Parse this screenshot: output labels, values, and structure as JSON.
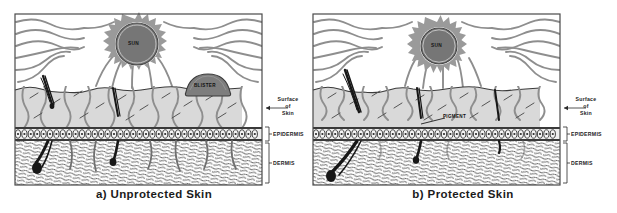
{
  "figure": {
    "type": "scientific-illustration",
    "panel_count": 2
  },
  "panels": [
    {
      "id": "a",
      "caption": "a)  Unprotected Skin",
      "sun_label": "SUN",
      "inner_labels": [
        {
          "name": "blister",
          "text": "BLISTER"
        }
      ],
      "side_labels": {
        "surface_line1": "Surface",
        "surface_line2": "of",
        "surface_line3": "Skin",
        "epidermis": "EPIDERMIS",
        "dermis": "DERMIS"
      }
    },
    {
      "id": "b",
      "caption": "b)  Protected Skin",
      "sun_label": "SUN",
      "inner_labels": [
        {
          "name": "pigment",
          "text": "PIGMENT"
        }
      ],
      "side_labels": {
        "surface_line1": "Surface",
        "surface_line2": "of",
        "surface_line3": "Skin",
        "epidermis": "EPIDERMIS",
        "dermis": "DERMIS"
      }
    }
  ],
  "colors": {
    "ray_gray": "#8e8e8e",
    "sun_fill": "#767676",
    "sun_burst": "#9a9a9a",
    "epidermis_fill": "#d9d9d9",
    "cell_band": "#3a3a3a",
    "dermis_hatch": "#2b2b2b",
    "frame": "#4a4a4a",
    "hair_dark": "#171717",
    "blister_fill": "#7d7d7d",
    "text": "#1b1b1b",
    "background": "#ffffff"
  }
}
